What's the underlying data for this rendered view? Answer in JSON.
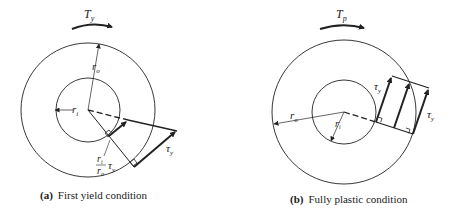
{
  "panel_a": {
    "torque_label": "T",
    "torque_sub": "y",
    "outer_radius_label": "r",
    "outer_radius_sub": "o",
    "inner_radius_label": "r",
    "inner_radius_sub": "i",
    "stress_label": "τ",
    "stress_sub": "y",
    "ratio_num": "r",
    "ratio_num_sub": "i",
    "ratio_den": "r",
    "ratio_den_sub": "o",
    "ratio_tau": "τ",
    "ratio_tau_sub": "y",
    "caption_tag": "(a)",
    "caption_text": "First yield condition"
  },
  "panel_b": {
    "torque_label": "T",
    "torque_sub": "p",
    "outer_radius_label": "r",
    "outer_radius_sub": "o",
    "inner_radius_label": "r",
    "inner_radius_sub": "i",
    "stress_label_top": "τ",
    "stress_label_top_sub": "y",
    "stress_label_right": "τ",
    "stress_label_right_sub": "y",
    "caption_tag": "(b)",
    "caption_text": "Fully plastic condition"
  },
  "colors": {
    "line": "#222222",
    "background": "#ffffff"
  }
}
